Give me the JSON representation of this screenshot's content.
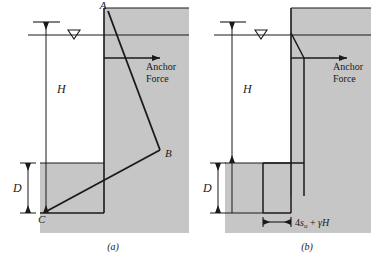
{
  "figure": {
    "panels": [
      {
        "id": "panel-a",
        "caption": "(a)",
        "labels": {
          "point_a": "A",
          "point_b": "B",
          "point_c": "C",
          "height": "H",
          "depth": "D",
          "anchor_line1": "Anchor",
          "anchor_line2": "Force"
        },
        "symbols": {
          "water_table": "water-table-icon"
        }
      },
      {
        "id": "panel-b",
        "caption": "(b)",
        "labels": {
          "height": "H",
          "depth": "D",
          "anchor_line1": "Anchor",
          "anchor_line2": "Force",
          "pressure_prefix": "4",
          "pressure_su": "s",
          "pressure_su_sub": "u",
          "pressure_plus": " + ",
          "pressure_gamma": "γ",
          "pressure_h": "H"
        },
        "symbols": {
          "water_table": "water-table-icon"
        }
      }
    ],
    "colors": {
      "soil_fill": "#c6c6c6",
      "line": "#1a1a1a",
      "background": "#ffffff"
    }
  }
}
